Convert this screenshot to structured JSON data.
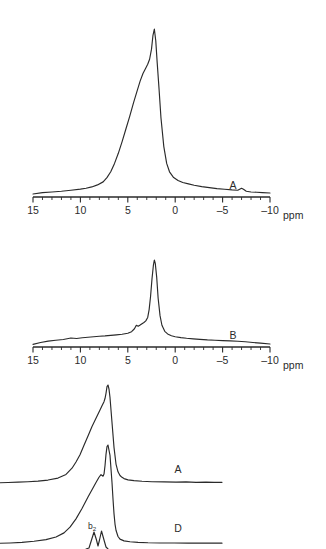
{
  "figure": {
    "background": "#ffffff",
    "line_color": "#2a2a2a",
    "axis_unit": "ppm"
  },
  "chart_data": [
    {
      "id": "spectrum-a",
      "type": "line",
      "title": "",
      "xlabel": "ppm",
      "ylabel": "",
      "trace_label": "A",
      "xlim": [
        15,
        -10
      ],
      "xticks": [
        15,
        10,
        5,
        0,
        -5,
        -10
      ],
      "xticklabels": [
        "15",
        "10",
        "5",
        "0",
        "-5",
        "-10"
      ],
      "minor_tick_step": 1,
      "grid": false,
      "legend": "none",
      "peak_ppm": 2.3,
      "x": [
        15.0,
        14.0,
        13.0,
        12.0,
        11.0,
        10.0,
        9.4,
        8.8,
        8.2,
        7.6,
        7.2,
        6.8,
        6.4,
        6.0,
        5.6,
        5.2,
        4.8,
        4.4,
        4.0,
        3.7,
        3.4,
        3.1,
        2.9,
        2.7,
        2.5,
        2.35,
        2.2,
        2.05,
        1.9,
        1.7,
        1.5,
        1.2,
        0.9,
        0.6,
        0.2,
        -0.3,
        -0.8,
        -1.4,
        -2.0,
        -2.8,
        -3.6,
        -4.4,
        -5.2,
        -6.0,
        -6.6,
        -7.0,
        -7.2,
        -7.5,
        -8.0,
        -8.6,
        -9.2,
        -10.0
      ],
      "y": [
        0.018,
        0.026,
        0.03,
        0.034,
        0.04,
        0.047,
        0.052,
        0.06,
        0.072,
        0.09,
        0.115,
        0.15,
        0.2,
        0.26,
        0.33,
        0.405,
        0.48,
        0.56,
        0.635,
        0.69,
        0.735,
        0.768,
        0.79,
        0.82,
        0.88,
        0.96,
        1.0,
        0.93,
        0.8,
        0.64,
        0.47,
        0.3,
        0.2,
        0.15,
        0.118,
        0.098,
        0.086,
        0.078,
        0.07,
        0.062,
        0.056,
        0.05,
        0.046,
        0.042,
        0.04,
        0.052,
        0.046,
        0.034,
        0.03,
        0.028,
        0.026,
        0.024
      ]
    },
    {
      "id": "spectrum-b",
      "type": "line",
      "title": "",
      "xlabel": "ppm",
      "ylabel": "",
      "trace_label": "B",
      "xlim": [
        15,
        -10
      ],
      "xticks": [
        15,
        10,
        5,
        0,
        -5,
        -10
      ],
      "xticklabels": [
        "15",
        "10",
        "5",
        "0",
        "-5",
        "-10"
      ],
      "minor_tick_step": 1,
      "grid": false,
      "legend": "none",
      "peak_ppm": 2.2,
      "x": [
        15.0,
        14.2,
        13.4,
        12.6,
        11.8,
        11.0,
        10.4,
        9.8,
        9.2,
        8.6,
        8.0,
        7.4,
        6.8,
        6.2,
        5.6,
        5.0,
        4.6,
        4.3,
        4.1,
        3.9,
        3.7,
        3.5,
        3.3,
        3.1,
        2.9,
        2.75,
        2.6,
        2.45,
        2.3,
        2.2,
        2.1,
        1.95,
        1.8,
        1.6,
        1.4,
        1.1,
        0.8,
        0.4,
        0.0,
        -0.6,
        -1.2,
        -1.9,
        -2.6,
        -3.4,
        -4.2,
        -5.0,
        -5.8,
        -6.6,
        -7.4,
        -8.2,
        -9.0,
        -10.0
      ],
      "y": [
        0.03,
        0.052,
        0.068,
        0.078,
        0.086,
        0.104,
        0.098,
        0.106,
        0.112,
        0.118,
        0.124,
        0.128,
        0.134,
        0.14,
        0.146,
        0.158,
        0.176,
        0.21,
        0.25,
        0.238,
        0.252,
        0.268,
        0.282,
        0.3,
        0.34,
        0.43,
        0.58,
        0.78,
        0.94,
        1.0,
        0.96,
        0.8,
        0.56,
        0.36,
        0.25,
        0.18,
        0.15,
        0.13,
        0.118,
        0.108,
        0.1,
        0.094,
        0.088,
        0.082,
        0.078,
        0.074,
        0.07,
        0.066,
        0.06,
        0.052,
        0.044,
        0.034
      ]
    },
    {
      "id": "spectrum-cd-a",
      "type": "line",
      "title": "",
      "xlabel": "",
      "ylabel": "",
      "trace_label": "A",
      "grid": false,
      "legend": "none",
      "note": "lower panel upper trace, horizontal axis cropped at left edge",
      "x": [
        0,
        8,
        18,
        28,
        38,
        48,
        58,
        66,
        72,
        76,
        80,
        84,
        88,
        92,
        96,
        100,
        102,
        104,
        105,
        106,
        107,
        108,
        109,
        110,
        112,
        114,
        116,
        118,
        120,
        122,
        124,
        128,
        134,
        142,
        152,
        164,
        176,
        186,
        196,
        206,
        214,
        222
      ],
      "y": [
        0.06,
        0.062,
        0.066,
        0.07,
        0.076,
        0.086,
        0.105,
        0.14,
        0.2,
        0.26,
        0.33,
        0.42,
        0.51,
        0.6,
        0.68,
        0.76,
        0.8,
        0.84,
        0.87,
        0.92,
        0.985,
        1.0,
        0.96,
        0.88,
        0.64,
        0.4,
        0.24,
        0.165,
        0.13,
        0.112,
        0.1,
        0.088,
        0.08,
        0.074,
        0.07,
        0.068,
        0.066,
        0.068,
        0.064,
        0.066,
        0.064,
        0.064
      ]
    },
    {
      "id": "spectrum-cd-d",
      "type": "line",
      "title": "",
      "xlabel": "",
      "ylabel": "",
      "trace_label": "D",
      "annotation": "b2",
      "grid": false,
      "legend": "none",
      "note": "lower panel bottom trace, horizontal axis cropped at left edge",
      "x": [
        0,
        10,
        22,
        34,
        46,
        56,
        64,
        70,
        76,
        82,
        88,
        92,
        96,
        99,
        101,
        103,
        104,
        105,
        106,
        107,
        108,
        110,
        112,
        113,
        114,
        115,
        116,
        118,
        120,
        124,
        130,
        138,
        148,
        160,
        174,
        188,
        202,
        214,
        222
      ],
      "y": [
        0.055,
        0.058,
        0.064,
        0.074,
        0.09,
        0.116,
        0.155,
        0.21,
        0.29,
        0.39,
        0.5,
        0.57,
        0.64,
        0.69,
        0.715,
        0.7,
        0.72,
        0.8,
        0.91,
        0.985,
        1.0,
        0.9,
        0.64,
        0.48,
        0.34,
        0.24,
        0.18,
        0.12,
        0.095,
        0.078,
        0.07,
        0.064,
        0.06,
        0.058,
        0.058,
        0.056,
        0.056,
        0.056,
        0.056
      ]
    }
  ],
  "panels": {
    "a": {
      "trace_label": "A",
      "unit_label": "ppm",
      "tick_labels": [
        "15",
        "10",
        "5",
        "0",
        "-5",
        "-10"
      ]
    },
    "b": {
      "trace_label": "B",
      "unit_label": "ppm",
      "tick_labels": [
        "15",
        "10",
        "5",
        "0",
        "-5",
        "-10"
      ]
    },
    "cd": {
      "trace_a_label": "A",
      "trace_d_label": "D",
      "peak_annotation_base": "b",
      "peak_annotation_sub": "2"
    }
  }
}
